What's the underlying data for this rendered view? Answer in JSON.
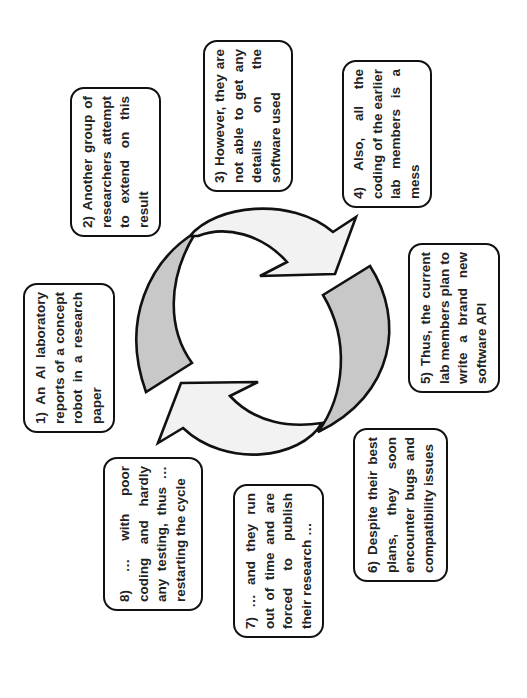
{
  "diagram": {
    "type": "cycle",
    "orientation": "rotated-90-ccw",
    "colors": {
      "arrow_light": "#f2f2f2",
      "arrow_gray": "#c8c8c8",
      "stroke": "#111111",
      "box_border": "#111111",
      "text": "#222222"
    },
    "steps": [
      {
        "id": 1,
        "text": "1) An AI laboratory reports of a concept robot in a research paper"
      },
      {
        "id": 2,
        "text": "2) Another group of researchers attempt to extend on this result"
      },
      {
        "id": 3,
        "text": "3) However, they are not able to get any details on the software used"
      },
      {
        "id": 4,
        "text": "4) Also, all the coding of the earlier lab members is a mess"
      },
      {
        "id": 5,
        "text": "5) Thus, the current lab members plan to write a brand new software API"
      },
      {
        "id": 6,
        "text": "6) Despite their best plans, they soon encounter bugs and compatibility issues"
      },
      {
        "id": 7,
        "text": "7) … and they run out of time and are forced to publish their research …"
      },
      {
        "id": 8,
        "text": "8) … with poor coding and hardly any testing, thus … restarting the cycle"
      }
    ],
    "arrows": [
      {
        "name": "top-arrow",
        "fill": "light"
      },
      {
        "name": "right-arrow",
        "fill": "gray"
      },
      {
        "name": "bottom-arrow",
        "fill": "light"
      },
      {
        "name": "left-arrow",
        "fill": "gray"
      }
    ]
  }
}
